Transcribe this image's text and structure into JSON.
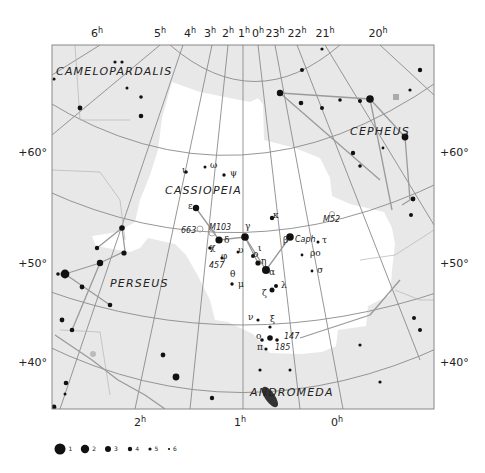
{
  "chart_title": "Cassiopeia constellation star chart",
  "colors": {
    "chart_background": "#e8e8e8",
    "constellation_area": "#ffffff",
    "grid_line": "#8a8a8a",
    "constellation_line": "#9a9a9a",
    "star": "#111111",
    "frame": "#888888"
  },
  "ra_labels_top": [
    {
      "label": "6",
      "sup": "h",
      "x": 97
    },
    {
      "label": "5",
      "sup": "h",
      "x": 160
    },
    {
      "label": "4",
      "sup": "h",
      "x": 190
    },
    {
      "label": "3",
      "sup": "h",
      "x": 210
    },
    {
      "label": "2",
      "sup": "h",
      "x": 228
    },
    {
      "label": "1",
      "sup": "h",
      "x": 244
    },
    {
      "label": "0",
      "sup": "h",
      "x": 258
    },
    {
      "label": "23",
      "sup": "h",
      "x": 275
    },
    {
      "label": "22",
      "sup": "h",
      "x": 297
    },
    {
      "label": "21",
      "sup": "h",
      "x": 325
    },
    {
      "label": "20",
      "sup": "h",
      "x": 378
    }
  ],
  "ra_labels_bottom": [
    {
      "label": "2",
      "sup": "h",
      "x": 140
    },
    {
      "label": "1",
      "sup": "h",
      "x": 240
    },
    {
      "label": "0",
      "sup": "h",
      "x": 337
    }
  ],
  "dec_labels_left": [
    {
      "label": "+60°",
      "y": 152
    },
    {
      "label": "+50°",
      "y": 263
    },
    {
      "label": "+40°",
      "y": 362
    }
  ],
  "dec_labels_right": [
    {
      "label": "+60°",
      "y": 152
    },
    {
      "label": "+50°",
      "y": 263
    },
    {
      "label": "+40°",
      "y": 362
    }
  ],
  "constellations": [
    {
      "name": "CAMELOPARDALIS",
      "x": 56,
      "y": 75
    },
    {
      "name": "CASSIOPEIA",
      "x": 165,
      "y": 194
    },
    {
      "name": "CEPHEUS",
      "x": 350,
      "y": 135
    },
    {
      "name": "PERSEUS",
      "x": 110,
      "y": 287
    },
    {
      "name": "ANDROMEDA",
      "x": 250,
      "y": 396
    }
  ],
  "star_labels": [
    {
      "text": "ι",
      "x": 182,
      "y": 173
    },
    {
      "text": "ω",
      "x": 210,
      "y": 168
    },
    {
      "text": "ψ",
      "x": 230,
      "y": 176
    },
    {
      "text": "ε",
      "x": 188,
      "y": 209
    },
    {
      "text": "κ",
      "x": 273,
      "y": 218
    },
    {
      "text": "δ",
      "x": 224,
      "y": 243
    },
    {
      "text": "γ",
      "x": 245,
      "y": 229
    },
    {
      "text": "β",
      "x": 283,
      "y": 243
    },
    {
      "text": "Caph",
      "x": 295,
      "y": 242
    },
    {
      "text": "τ",
      "x": 322,
      "y": 243
    },
    {
      "text": "χ",
      "x": 210,
      "y": 250
    },
    {
      "text": "υ",
      "x": 238,
      "y": 253
    },
    {
      "text": "ο",
      "x": 253,
      "y": 257
    },
    {
      "text": "ι",
      "x": 258,
      "y": 251
    },
    {
      "text": "φ",
      "x": 221,
      "y": 259
    },
    {
      "text": "η",
      "x": 261,
      "y": 264
    },
    {
      "text": "ρο",
      "x": 310,
      "y": 256
    },
    {
      "text": "α",
      "x": 269,
      "y": 275
    },
    {
      "text": "σ",
      "x": 317,
      "y": 273
    },
    {
      "text": "θ",
      "x": 230,
      "y": 277
    },
    {
      "text": "μ",
      "x": 238,
      "y": 287
    },
    {
      "text": "λ",
      "x": 281,
      "y": 288
    },
    {
      "text": "ζ",
      "x": 262,
      "y": 296
    },
    {
      "text": "ν",
      "x": 248,
      "y": 320
    },
    {
      "text": "ξ",
      "x": 270,
      "y": 322
    },
    {
      "text": "ο",
      "x": 256,
      "y": 339
    },
    {
      "text": "π",
      "x": 257,
      "y": 350
    }
  ],
  "deep_sky_labels": [
    {
      "text": "M103",
      "x": 209,
      "y": 230
    },
    {
      "text": "663",
      "x": 181,
      "y": 233
    },
    {
      "text": "M52",
      "x": 323,
      "y": 222
    },
    {
      "text": "457",
      "x": 209,
      "y": 268
    },
    {
      "text": "147",
      "x": 284,
      "y": 339
    },
    {
      "text": "185",
      "x": 275,
      "y": 350
    }
  ],
  "legend": {
    "title": "Star magnitude",
    "items": [
      {
        "mag": "1",
        "r": 5.5,
        "x": 60
      },
      {
        "mag": "2",
        "r": 4.2,
        "x": 85
      },
      {
        "mag": "3",
        "r": 3.0,
        "x": 108
      },
      {
        "mag": "4",
        "r": 2.2,
        "x": 130
      },
      {
        "mag": "5",
        "r": 1.6,
        "x": 150
      },
      {
        "mag": "6",
        "r": 1.1,
        "x": 169
      }
    ]
  }
}
